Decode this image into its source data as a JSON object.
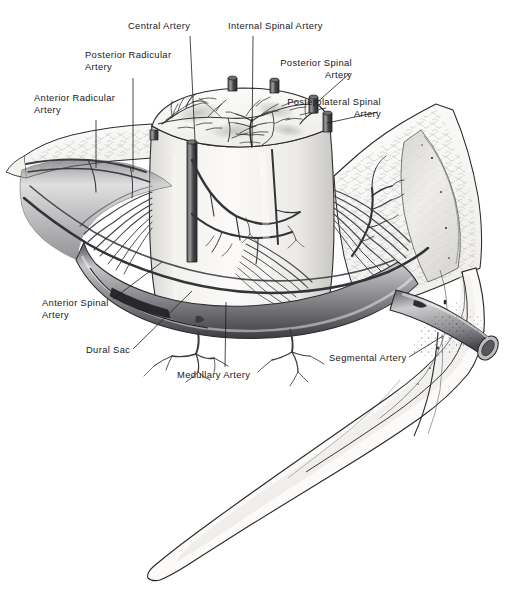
{
  "figure": {
    "kind": "anatomical-line-illustration",
    "style": "grayscale medical illustration, pen-and-ink with wash",
    "background_color": "#ffffff",
    "ink_color": "#1a1a1c",
    "vessel_color": "#3a3a3e",
    "cord_fill": "#f6f5f2",
    "bone_fill": "#fbfaf8",
    "gray_matter_shade": "#cfcfcb"
  },
  "labels": [
    {
      "id": "central-artery",
      "text": "Central Artery",
      "align": "center",
      "x": 128,
      "y": 20,
      "leader": [
        [
          190,
          36
        ],
        [
          196,
          162
        ]
      ]
    },
    {
      "id": "internal-spinal-artery",
      "text": "Internal Spinal Artery",
      "align": "center",
      "x": 228,
      "y": 20,
      "leader": [
        [
          253,
          36
        ],
        [
          252,
          147
        ]
      ]
    },
    {
      "id": "posterior-radicular-artery",
      "text": "Posterior Radicular\nArtery",
      "align": "left",
      "x": 85,
      "y": 49,
      "leader": [
        [
          133,
          78
        ],
        [
          133,
          172
        ]
      ]
    },
    {
      "id": "anterior-radicular-artery",
      "text": "Anterior Radicular\nArtery",
      "align": "left",
      "x": 34,
      "y": 92,
      "leader": [
        [
          96,
          120
        ],
        [
          96,
          168
        ]
      ]
    },
    {
      "id": "posterior-spinal-artery",
      "text": "Posterior Spinal\nArtery",
      "align": "right",
      "x": 352,
      "y": 57,
      "leader": [
        [
          350,
          73
        ],
        [
          313,
          106
        ]
      ]
    },
    {
      "id": "posterolateral-spinal-artery",
      "text": "Posterolateral Spinal\nArtery",
      "align": "right",
      "x": 381,
      "y": 96,
      "leader": [
        [
          378,
          112
        ],
        [
          327,
          123
        ]
      ]
    },
    {
      "id": "anterior-spinal-artery",
      "text": "Anterior Spinal\nArtery",
      "align": "left",
      "x": 42,
      "y": 297,
      "leader": [
        [
          113,
          299
        ],
        [
          162,
          262
        ]
      ]
    },
    {
      "id": "dural-sac",
      "text": "Dural Sac",
      "align": "left",
      "x": 86,
      "y": 344,
      "leader": [
        [
          133,
          349
        ],
        [
          192,
          291
        ]
      ]
    },
    {
      "id": "medullary-artery",
      "text": "Medullary Artery",
      "align": "left",
      "x": 177,
      "y": 369,
      "leader": [
        [
          225,
          367
        ],
        [
          226,
          302
        ]
      ]
    },
    {
      "id": "segmental-artery",
      "text": "Segmental Artery",
      "align": "left",
      "x": 329,
      "y": 352,
      "leader": [
        [
          409,
          357
        ],
        [
          443,
          336
        ]
      ]
    }
  ],
  "structures": [
    {
      "id": "spinal-cord-segment",
      "name": "Spinal cord segment (cut cylinder)"
    },
    {
      "id": "cord-cut-surface",
      "name": "Cut superior surface of cord with gray matter"
    },
    {
      "id": "cut-vessel-stump",
      "name": "Cut arterial stumps on cord surface",
      "count": 6
    },
    {
      "id": "vertebral-body",
      "name": "Vertebral body with cancellous bone"
    },
    {
      "id": "pedicle",
      "name": "Inferior vertebral process"
    },
    {
      "id": "nerve-roots",
      "name": "Nerve root filaments"
    },
    {
      "id": "dural-sleeve",
      "name": "Dural sleeve / sac"
    },
    {
      "id": "segmental-vessel",
      "name": "Segmental artery cut cylinder"
    },
    {
      "id": "medullary-branches",
      "name": "Medullary artery branches"
    }
  ]
}
